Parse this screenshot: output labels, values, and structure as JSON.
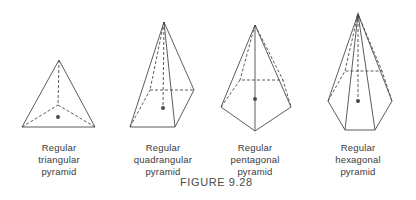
{
  "figure": {
    "caption": "FIGURE 9.28",
    "stroke_color": "#4a4a4a",
    "items": [
      {
        "name": "triangular",
        "label": [
          "Regular",
          "triangular",
          "pyramid"
        ]
      },
      {
        "name": "quadrangular",
        "label": [
          "Regular",
          "quadrangular",
          "pyramid"
        ]
      },
      {
        "name": "pentagonal",
        "label": [
          "Regular",
          "pentagonal",
          "pyramid"
        ]
      },
      {
        "name": "hexagonal",
        "label": [
          "Regular",
          "hexagonal",
          "pyramid"
        ]
      }
    ]
  }
}
